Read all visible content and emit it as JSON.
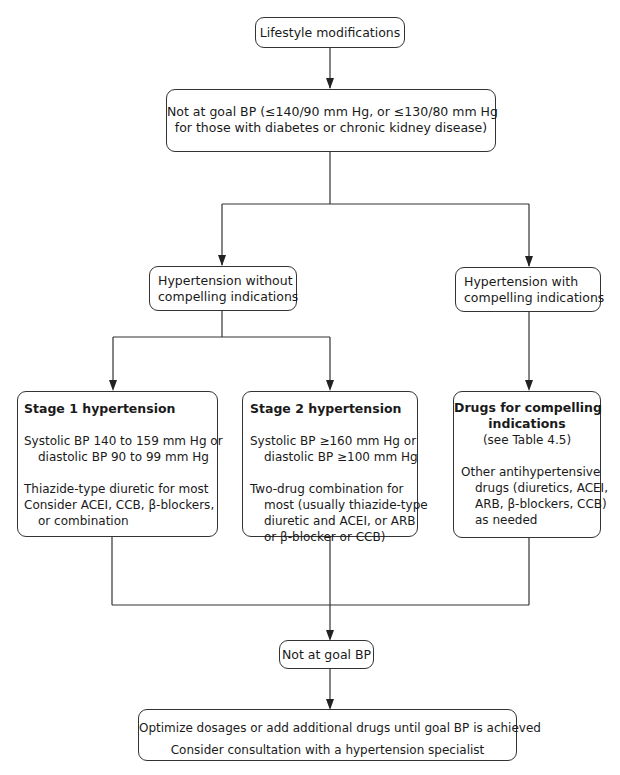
{
  "diagram": {
    "type": "flowchart",
    "nodes": {
      "lifestyle": {
        "text": "Lifestyle modifications"
      },
      "not_at_goal_1": {
        "lines": [
          "Not at goal BP (≤140/90 mm Hg, or ≤130/80 mm Hg",
          "for those with diabetes or chronic kidney disease)"
        ]
      },
      "without_ci": {
        "lines": [
          "Hypertension without",
          "compelling indications"
        ]
      },
      "with_ci": {
        "lines": [
          "Hypertension with",
          "compelling indications"
        ]
      },
      "stage1": {
        "title": "Stage 1 hypertension",
        "criteria": [
          "Systolic BP 140 to 159 mm Hg or",
          "diastolic BP 90 to 99 mm Hg"
        ],
        "treatment": [
          "Thiazide-type diuretic for most",
          "Consider ACEI, CCB, β-blockers,",
          "or combination"
        ]
      },
      "stage2": {
        "title": "Stage 2 hypertension",
        "criteria": [
          "Systolic BP ≥160 mm Hg or",
          "diastolic BP ≥100 mm Hg"
        ],
        "treatment": [
          "Two-drug combination for",
          "most (usually thiazide-type",
          "diuretic and ACEI, or ARB",
          "or β-blocker or CCB)"
        ]
      },
      "compelling": {
        "title": [
          "Drugs for compelling",
          "indications"
        ],
        "reference": "(see Table 4.5)",
        "treatment": [
          "Other antihypertensive",
          "drugs (diuretics, ACEI,",
          "ARB, β-blockers, CCB)",
          "as needed"
        ]
      },
      "not_at_goal_2": {
        "text": "Not at goal BP"
      },
      "optimize": {
        "lines": [
          "Optimize dosages or add additional drugs until goal BP is achieved",
          "Consider consultation with a hypertension specialist"
        ]
      }
    },
    "edges": [
      [
        "lifestyle",
        "not_at_goal_1"
      ],
      [
        "not_at_goal_1",
        "without_ci"
      ],
      [
        "not_at_goal_1",
        "with_ci"
      ],
      [
        "without_ci",
        "stage1"
      ],
      [
        "without_ci",
        "stage2"
      ],
      [
        "with_ci",
        "compelling"
      ],
      [
        "stage1",
        "not_at_goal_2"
      ],
      [
        "stage2",
        "not_at_goal_2"
      ],
      [
        "compelling",
        "not_at_goal_2"
      ],
      [
        "not_at_goal_2",
        "optimize"
      ]
    ],
    "colors": {
      "line": "#333333",
      "text": "#1a1a1a",
      "background": "#ffffff"
    }
  }
}
